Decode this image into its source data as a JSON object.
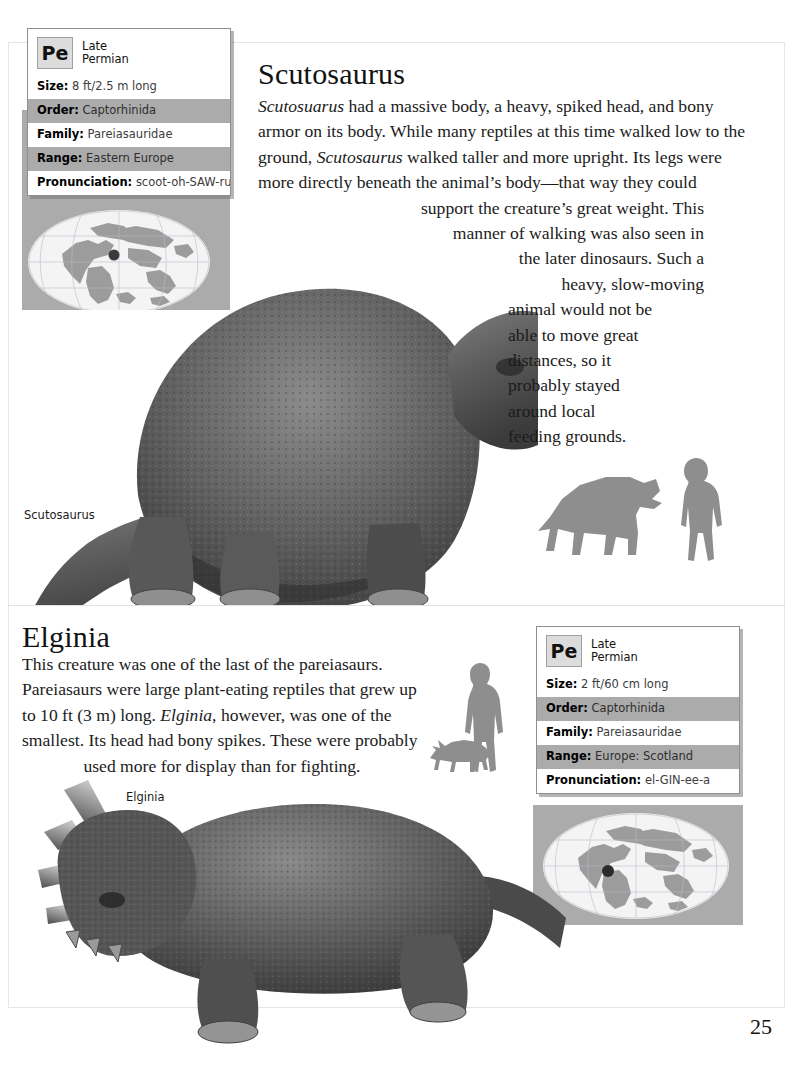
{
  "page": {
    "number": "25"
  },
  "scutosaurus": {
    "heading": "Scutosaurus",
    "caption": "Scutosaurus",
    "paragraph_lines": [
      "Scutosuarus had a massive body, a heavy, spiked head, and bony",
      "armor on its body. While many reptiles at this time walked low to the",
      "ground, Scutosaurus walked taller and more upright. Its legs were",
      "more directly beneath the animal’s body—that way they could",
      "support the creature’s great weight. This",
      "manner of walking was also seen in",
      "the later dinosaurs. Such a",
      "heavy, slow-moving",
      "animal would not be",
      "able to move great",
      "distances, so it",
      "probably stayed",
      "around local",
      "feeding grounds."
    ],
    "infobox": {
      "epoch_badge": "Pe",
      "epoch_line1": "Late",
      "epoch_line2": "Permian",
      "rows": [
        {
          "label": "Size:",
          "value": "8 ft/2.5 m long",
          "shaded": false
        },
        {
          "label": "Order:",
          "value": "Captorhinida",
          "shaded": true
        },
        {
          "label": "Family:",
          "value": "Pareiasauridae",
          "shaded": false
        },
        {
          "label": "Range:",
          "value": "Eastern Europe",
          "shaded": true
        },
        {
          "label": "Pronunciation:",
          "value": "scoot-oh-SAW-rus",
          "shaded": false
        }
      ]
    },
    "map": {
      "marker_label": "Eastern Europe location marker"
    },
    "scale": {
      "animal": "scutosaurus-silhouette",
      "human": "human-silhouette"
    }
  },
  "elginia": {
    "heading": "Elginia",
    "caption": "Elginia",
    "paragraph_lines": [
      "This creature was one of the last of the pareiasaurs.",
      "Pareiasaurs were large plant-eating reptiles that grew up",
      "to 10 ft (3 m) long. Elginia, however, was one of the",
      "smallest. Its head had bony spikes. These were probably",
      "used more for display than for fighting."
    ],
    "infobox": {
      "epoch_badge": "Pe",
      "epoch_line1": "Late",
      "epoch_line2": "Permian",
      "rows": [
        {
          "label": "Size:",
          "value": "2 ft/60 cm long",
          "shaded": false
        },
        {
          "label": "Order:",
          "value": "Captorhinida",
          "shaded": true
        },
        {
          "label": "Family:",
          "value": "Pareiasauridae",
          "shaded": false
        },
        {
          "label": "Range:",
          "value": "Europe: Scotland",
          "shaded": true
        },
        {
          "label": "Pronunciation:",
          "value": "el-GIN-ee-a",
          "shaded": false
        }
      ]
    },
    "map": {
      "marker_label": "Scotland location marker"
    },
    "scale": {
      "animal": "elginia-silhouette",
      "human": "human-silhouette"
    }
  },
  "colors": {
    "row_shaded": "#ababab",
    "row_plain": "#ffffff",
    "badge_bg": "#dcdcdc",
    "map_panel": "#ababab",
    "map_ocean": "#f4f4f4",
    "map_land": "#9d9d9d",
    "silhouette": "#8e8e8e",
    "frame": "#e6e6e6",
    "text": "#1b1b1b"
  }
}
